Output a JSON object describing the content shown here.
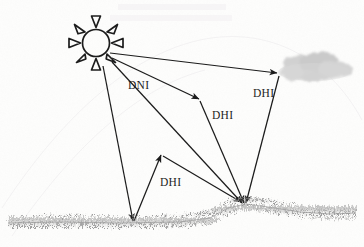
{
  "diagram": {
    "background_color": "#fdfdfc",
    "ink_color": "#1c1c1c",
    "cloud_color": "#c9c9c9",
    "grass_color": "#8e8e8e",
    "sun": {
      "name": "sun",
      "center_x": 96,
      "center_y": 43,
      "radius": 14,
      "ray_count": 8
    },
    "cloud": {
      "name": "cloud",
      "x": 288,
      "y": 55,
      "width": 68,
      "height": 26
    },
    "ground": {
      "name": "ground-grass-line",
      "left_y": 222,
      "hill_peak_x": 244,
      "hill_peak_y": 203,
      "right_y": 214
    },
    "labels": [
      {
        "id": "dni",
        "text": "DNI",
        "x": 128,
        "y": 89
      },
      {
        "id": "dhi-mid",
        "text": "DHI",
        "x": 212,
        "y": 119
      },
      {
        "id": "dhi-cloud",
        "text": "DHI",
        "x": 253,
        "y": 97
      },
      {
        "id": "dhi-ground",
        "text": "DHI",
        "x": 160,
        "y": 186
      }
    ],
    "rays": [
      {
        "id": "ray-to-cloud",
        "from": "sun",
        "to": "cloud",
        "label": "DHI"
      },
      {
        "id": "ray-to-midair",
        "from": "sun",
        "to": "air-scatter-point",
        "label": "DNI"
      },
      {
        "id": "ray-to-hill",
        "from": "sun",
        "to": "hill-peak",
        "label": "DNI"
      },
      {
        "id": "ray-sun-to-flat-ground",
        "from": "sun",
        "to": "flat-ground",
        "label": ""
      },
      {
        "id": "ray-cloud-to-hill",
        "from": "cloud",
        "to": "hill-peak",
        "label": "DHI"
      },
      {
        "id": "ray-midair-to-hill",
        "from": "air-scatter-point",
        "to": "hill-peak",
        "label": "DHI"
      },
      {
        "id": "ray-ground-bounce-up",
        "from": "flat-ground",
        "to": "reflect-point",
        "label": "DHI"
      },
      {
        "id": "ray-reflect-to-hill",
        "from": "reflect-point",
        "to": "hill-peak",
        "label": ""
      }
    ],
    "ghost_line_1": "",
    "ghost_line_2": ""
  }
}
